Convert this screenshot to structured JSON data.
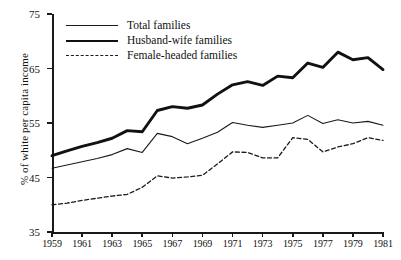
{
  "chart_data": {
    "type": "line",
    "title": "",
    "xlabel": "",
    "ylabel": "% of white per capita income",
    "xlim": [
      1959,
      1981
    ],
    "ylim": [
      35,
      75
    ],
    "yticks": [
      35,
      45,
      55,
      65,
      75
    ],
    "xticks": [
      1959,
      1961,
      1963,
      1965,
      1967,
      1969,
      1971,
      1973,
      1975,
      1977,
      1979,
      1981
    ],
    "grid": false,
    "legend_position": "top-left-inside",
    "x": [
      1959,
      1960,
      1961,
      1962,
      1963,
      1964,
      1965,
      1966,
      1967,
      1968,
      1969,
      1970,
      1971,
      1972,
      1973,
      1974,
      1975,
      1976,
      1977,
      1978,
      1979,
      1980,
      1981
    ],
    "series": [
      {
        "name": "Total families",
        "style": "thin-solid",
        "color": "#1a1a1a",
        "values": [
          46.7,
          47.3,
          47.9,
          48.5,
          49.2,
          50.3,
          49.6,
          53.1,
          52.5,
          51.2,
          52.2,
          53.3,
          55.1,
          54.6,
          54.2,
          54.6,
          55.0,
          56.4,
          54.9,
          55.6,
          55.0,
          55.3,
          54.6
        ]
      },
      {
        "name": "Husband-wife families",
        "style": "thick-solid",
        "color": "#111111",
        "values": [
          49.0,
          49.9,
          50.7,
          51.4,
          52.2,
          53.6,
          53.4,
          57.3,
          58.0,
          57.7,
          58.3,
          60.3,
          62.0,
          62.6,
          61.9,
          63.6,
          63.3,
          66.0,
          65.2,
          68.0,
          66.6,
          67.0,
          64.8
        ]
      },
      {
        "name": "Female-headed families",
        "style": "dashed",
        "color": "#1a1a1a",
        "values": [
          40.0,
          40.3,
          40.8,
          41.2,
          41.6,
          41.9,
          43.2,
          45.3,
          44.9,
          45.1,
          45.4,
          47.5,
          49.7,
          49.6,
          48.6,
          48.6,
          52.3,
          52.0,
          49.7,
          50.6,
          51.2,
          52.3,
          51.8
        ]
      }
    ]
  },
  "legend": {
    "items": [
      {
        "label": "Total families",
        "style": "thin-solid"
      },
      {
        "label": "Husband-wife families",
        "style": "thick-solid"
      },
      {
        "label": "Female-headed families",
        "style": "dashed"
      }
    ]
  }
}
